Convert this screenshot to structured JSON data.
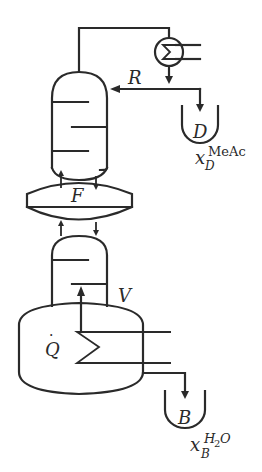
{
  "diagram": {
    "labels": {
      "reflux": "R",
      "distillate": "D",
      "distillate_composition_base": "x",
      "distillate_composition_sub": "D",
      "distillate_composition_sup": "MeAc",
      "feed": "F",
      "vapor": "V",
      "heat_duty": "Q",
      "heat_duty_dot": "·",
      "bottoms": "B",
      "bottoms_composition_base": "x",
      "bottoms_composition_sub": "B",
      "bottoms_composition_sup_main": "H",
      "bottoms_composition_sup_sub": "2",
      "bottoms_composition_sup_tail": "O"
    },
    "components": [
      "condenser",
      "rectifying-section",
      "feed-section",
      "stripping-section",
      "reboiler",
      "distillate-receiver",
      "bottoms-receiver"
    ],
    "colors": {
      "line": "#2a2a2a",
      "background": "#ffffff"
    }
  }
}
